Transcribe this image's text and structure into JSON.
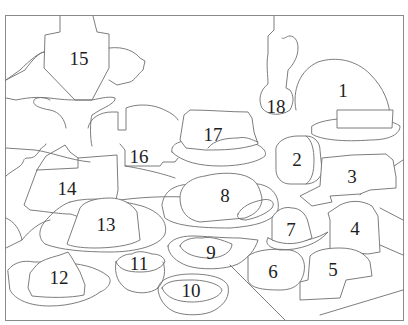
{
  "page": {
    "type": "color-by-number line art",
    "background": "#ffffff",
    "line_color": "#6e6e6e",
    "number_color": "#1e1e1e"
  },
  "regions": [
    {
      "id": 1,
      "label": "1",
      "x": 343,
      "y": 90
    },
    {
      "id": 2,
      "label": "2",
      "x": 297,
      "y": 159
    },
    {
      "id": 3,
      "label": "3",
      "x": 352,
      "y": 176
    },
    {
      "id": 4,
      "label": "4",
      "x": 355,
      "y": 228
    },
    {
      "id": 5,
      "label": "5",
      "x": 333,
      "y": 269
    },
    {
      "id": 6,
      "label": "6",
      "x": 273,
      "y": 271
    },
    {
      "id": 7,
      "label": "7",
      "x": 291,
      "y": 229
    },
    {
      "id": 8,
      "label": "8",
      "x": 225,
      "y": 195
    },
    {
      "id": 9,
      "label": "9",
      "x": 211,
      "y": 252
    },
    {
      "id": 10,
      "label": "10",
      "x": 191,
      "y": 290
    },
    {
      "id": 11,
      "label": "11",
      "x": 139,
      "y": 263
    },
    {
      "id": 12,
      "label": "12",
      "x": 59,
      "y": 277
    },
    {
      "id": 13,
      "label": "13",
      "x": 106,
      "y": 224
    },
    {
      "id": 14,
      "label": "14",
      "x": 67,
      "y": 188
    },
    {
      "id": 15,
      "label": "15",
      "x": 79,
      "y": 58
    },
    {
      "id": 16,
      "label": "16",
      "x": 139,
      "y": 156
    },
    {
      "id": 17,
      "label": "17",
      "x": 213,
      "y": 134
    },
    {
      "id": 18,
      "label": "18",
      "x": 276,
      "y": 106
    }
  ]
}
